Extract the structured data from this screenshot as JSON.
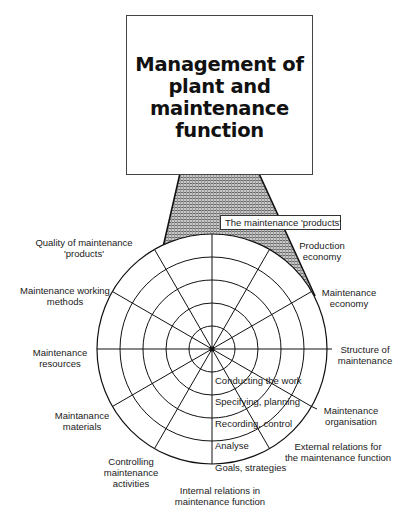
{
  "title": {
    "lines": [
      "Management of",
      "plant and",
      "maintenance",
      "function"
    ]
  },
  "cone_label": "The maintenance 'products'",
  "outer_labels": {
    "quality": [
      "Quality of maintenance",
      "'products'"
    ],
    "working_methods": [
      "Maintenance working",
      "methods"
    ],
    "resources": [
      "Maintenance",
      "resources"
    ],
    "materials": [
      "Maintanance",
      "materials"
    ],
    "controlling": [
      "Controlling",
      "maintenance",
      "activities"
    ],
    "internal": [
      "Internal relations in",
      "maintenance function"
    ],
    "external": [
      "External relations for",
      "the maintenance function"
    ],
    "organisation": [
      "Maintenance",
      "organisation"
    ],
    "structure": [
      "Structure of",
      "maintenance"
    ],
    "maintenance_economy": [
      "Maintenance",
      "economy"
    ],
    "production_economy": [
      "Production",
      "economy"
    ]
  },
  "ring_labels": [
    "Conducting the work",
    "Specifying, planning",
    "Recording, control",
    "Analyse",
    "Goals, strategies"
  ],
  "geometry": {
    "center": [
      212,
      349
    ],
    "radius": 115,
    "rings": 5,
    "spokes": 12
  }
}
